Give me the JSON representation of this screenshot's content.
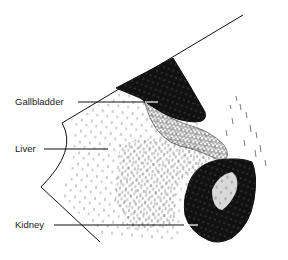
{
  "diagram": {
    "type": "ultrasound-sketch",
    "labels": [
      {
        "id": "gallbladder",
        "text": "Gallbladder",
        "x": 15,
        "y": 97,
        "line": [
          78,
          102,
          158,
          102
        ]
      },
      {
        "id": "liver",
        "text": "Liver",
        "x": 15,
        "y": 144,
        "line": [
          44,
          149,
          108,
          149
        ]
      },
      {
        "id": "kidney",
        "text": "Kidney",
        "x": 15,
        "y": 220,
        "line": [
          54,
          225,
          198,
          225
        ]
      }
    ],
    "colors": {
      "ink": "#111111",
      "background": "#ffffff",
      "label": "#222222"
    }
  }
}
